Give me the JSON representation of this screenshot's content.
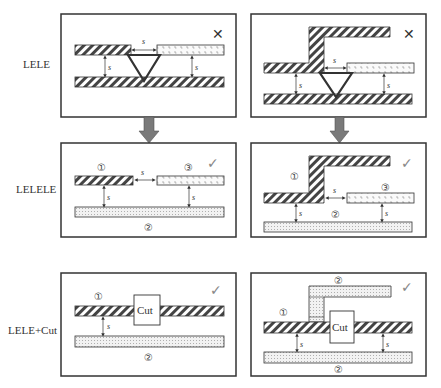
{
  "rows": [
    {
      "label": "LELE",
      "status_left": "cross",
      "status_right": "cross"
    },
    {
      "label": "LELELE",
      "status_left": "check",
      "status_right": "check"
    },
    {
      "label": "LELE+Cut",
      "status_left": "check",
      "status_right": "check"
    }
  ],
  "spacing_label": "s",
  "mask_labels": {
    "one": "①",
    "two": "②",
    "three": "③"
  },
  "cut_label": "Cut",
  "icons": {
    "cross": "✕",
    "check": "✓"
  },
  "colors": {
    "border": "#333333",
    "arrow": "#7a7a7a",
    "check": "#888888",
    "cross": "#333333"
  }
}
